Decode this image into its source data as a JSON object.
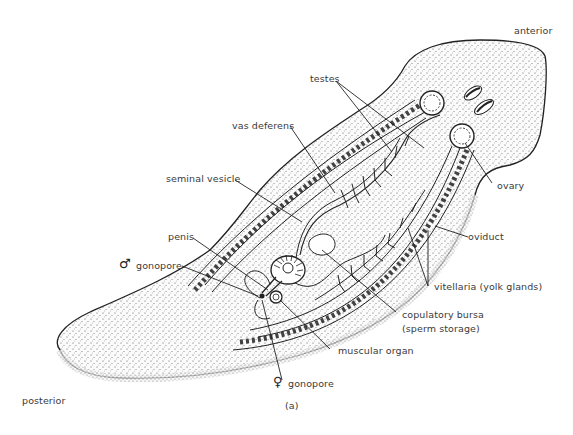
{
  "figure": {
    "panel_label": "(a)",
    "orientation": {
      "anterior": "anterior",
      "posterior": "posterior"
    },
    "labels": {
      "testes": "testes",
      "vas_deferens": "vas deferens",
      "seminal_vesicle": "seminal vesicle",
      "penis": "penis",
      "male_gonopore": "gonopore",
      "male_symbol": "♂",
      "ovary": "ovary",
      "oviduct": "oviduct",
      "vitellaria": "vitellaria (yolk glands)",
      "copulatory_bursa": "copulatory bursa",
      "copulatory_bursa_note": "(sperm storage)",
      "muscular_organ": "muscular organ",
      "female_gonopore": "gonopore",
      "female_symbol": "♀"
    }
  }
}
